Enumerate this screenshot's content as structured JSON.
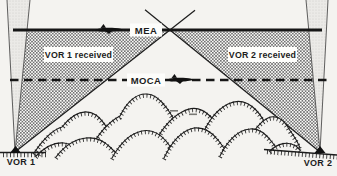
{
  "diagram": {
    "type": "aviation-mea-moca-vor-coverage-diagram",
    "labels": {
      "mea": "MEA",
      "moca": "MOCA",
      "vor1_received": "VOR 1 received",
      "vor2_received": "VOR 2 received",
      "vor1_station": "VOR 1",
      "vor2_station": "VOR 2"
    },
    "icons": {
      "mea_airplane": "airplane-icon",
      "moca_airplane": "airplane-icon"
    },
    "colors": {
      "ink": "#1c1c1c",
      "paper": "#f4f3f0",
      "hatch_line": "#5f5f5f",
      "cone_fill": "#ebeae7",
      "label_background": "#fdfdfb"
    }
  }
}
